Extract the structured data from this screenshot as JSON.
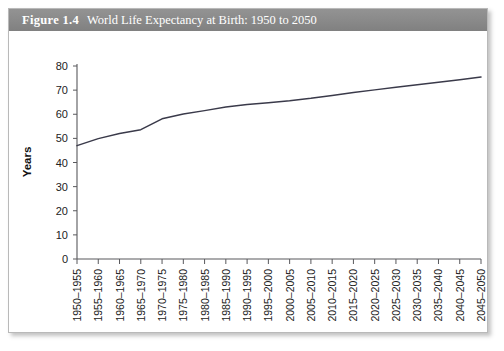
{
  "figure": {
    "number_label": "Figure 1.4",
    "title": "World Life Expectancy at Birth: 1950 to 2050"
  },
  "chart_data": {
    "type": "line",
    "title": "World Life Expectancy at Birth: 1950 to 2050",
    "xlabel": "",
    "ylabel": "Years",
    "ylim": [
      0,
      80
    ],
    "yticks": [
      0,
      10,
      20,
      30,
      40,
      50,
      60,
      70,
      80
    ],
    "grid": false,
    "legend": null,
    "categories": [
      "1950–1955",
      "1955–1960",
      "1960–1965",
      "1965–1970",
      "1970–1975",
      "1975–1980",
      "1980–1985",
      "1985–1990",
      "1990–1995",
      "1995–2000",
      "2000–2005",
      "2005–2010",
      "2010–2015",
      "2015–2020",
      "2020–2025",
      "2025–2030",
      "2030–2035",
      "2035–2040",
      "2040–2045",
      "2045–2050"
    ],
    "values": [
      47.0,
      49.9,
      52.0,
      53.6,
      58.1,
      60.1,
      61.5,
      63.0,
      64.0,
      64.8,
      65.6,
      66.6,
      67.8,
      69.0,
      70.1,
      71.2,
      72.2,
      73.3,
      74.3,
      75.4
    ]
  },
  "colors": {
    "header_bar": "#8c8c8c",
    "header_text": "#ffffff",
    "line": "#3a3a4a",
    "axis": "#58585c",
    "card_border": "#b9b9b9",
    "page_background": "#ffffff"
  }
}
